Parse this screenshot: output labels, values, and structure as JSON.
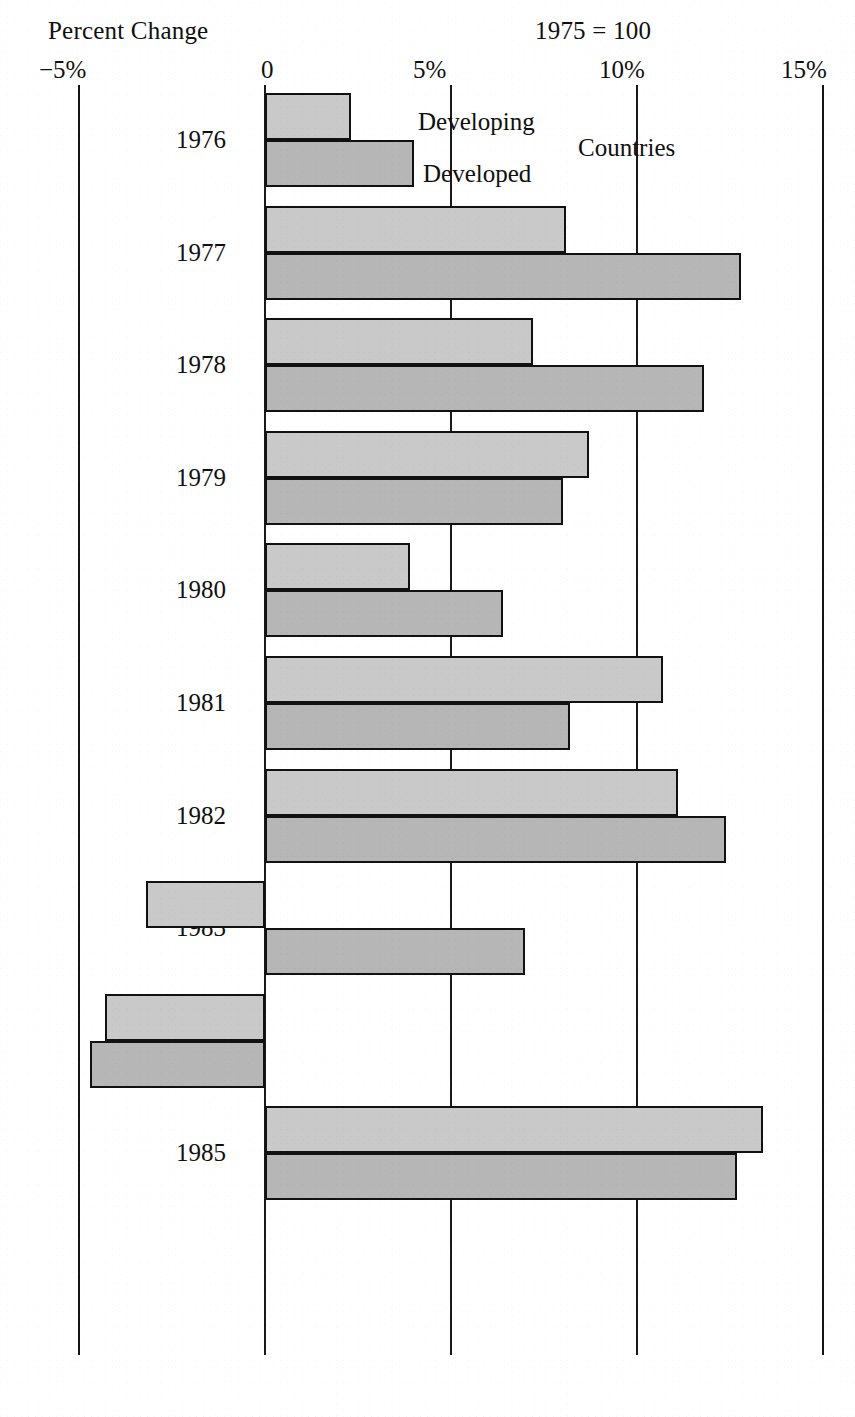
{
  "header": {
    "left_title": "Percent Change",
    "right_note": "1975  =  100"
  },
  "legend": {
    "series1_label": "Developing",
    "series2_label": "Developed",
    "suffix_label": "Countries"
  },
  "axis": {
    "ticks": [
      "−5%",
      "0",
      "5%",
      "10%",
      "15%"
    ],
    "tick_values": [
      -5,
      0,
      5,
      10,
      15
    ]
  },
  "colors": {
    "developing_fill": "#c9c9c9",
    "developed_fill": "#b6b6b6",
    "stroke": "#111111",
    "gridline": "#1a1a1a",
    "background": "#ffffff"
  },
  "chart_data": {
    "type": "bar",
    "orientation": "horizontal",
    "title": "Percent Change",
    "subtitle": "1975 = 100",
    "xlabel": "",
    "ylabel": "",
    "xlim": [
      -5,
      15
    ],
    "xticks": [
      -5,
      0,
      5,
      10,
      15
    ],
    "xticklabels": [
      "−5%",
      "0",
      "5%",
      "10%",
      "15%"
    ],
    "grid": true,
    "legend": [
      "Developing Countries",
      "Developed Countries"
    ],
    "legend_position": "inside-top",
    "categories": [
      "1976",
      "1977",
      "1978",
      "1979",
      "1980",
      "1981",
      "1982",
      "1983",
      "1984",
      "1985"
    ],
    "series": [
      {
        "name": "Developing",
        "values": [
          2.3,
          8.1,
          7.2,
          8.7,
          3.9,
          10.7,
          11.1,
          -3.2,
          -4.3,
          13.4
        ]
      },
      {
        "name": "Developed",
        "values": [
          4.0,
          12.8,
          11.8,
          8.0,
          6.4,
          8.2,
          12.4,
          7.0,
          -4.7,
          12.7
        ]
      }
    ]
  },
  "rows": [
    {
      "year": "1976",
      "developing": 2.3,
      "developed": 4.0
    },
    {
      "year": "1977",
      "developing": 8.1,
      "developed": 12.8
    },
    {
      "year": "1978",
      "developing": 7.2,
      "developed": 11.8
    },
    {
      "year": "1979",
      "developing": 8.7,
      "developed": 8.0
    },
    {
      "year": "1980",
      "developing": 3.9,
      "developed": 6.4
    },
    {
      "year": "1981",
      "developing": 10.7,
      "developed": 8.2
    },
    {
      "year": "1982",
      "developing": 11.1,
      "developed": 12.4
    },
    {
      "year": "1983",
      "developing": -3.2,
      "developed": 7.0
    },
    {
      "year": "1984",
      "developing": -4.3,
      "developed": -4.7
    },
    {
      "year": "1985",
      "developing": 13.4,
      "developed": 12.7
    }
  ]
}
